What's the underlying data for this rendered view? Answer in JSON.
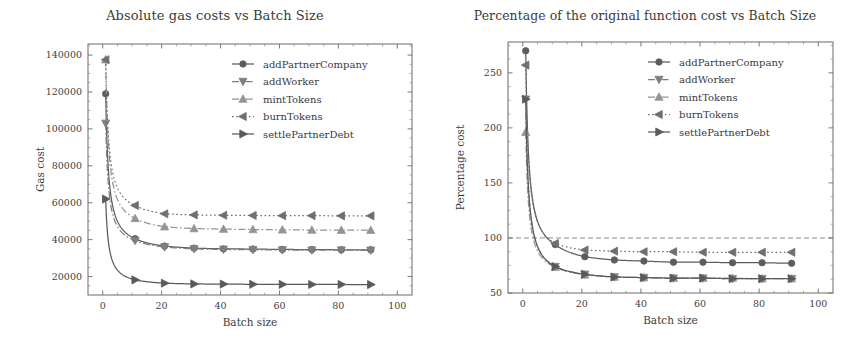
{
  "figure": {
    "width": 860,
    "height": 346,
    "background": "#ffffff",
    "ink_color": "#4a4a4a"
  },
  "series_style": [
    {
      "name": "addPartnerCompany",
      "color": "#5d5d5d",
      "marker": "circle",
      "dash": "none"
    },
    {
      "name": "addWorker",
      "color": "#7f7f7f",
      "marker": "triangle-down",
      "dash": "dashdot"
    },
    {
      "name": "mintTokens",
      "color": "#949494",
      "marker": "triangle-up",
      "dash": "dashdot"
    },
    {
      "name": "burnTokens",
      "color": "#6f6f6f",
      "marker": "triangle-left",
      "dash": "dotted"
    },
    {
      "name": "settlePartnerDebt",
      "color": "#5a5a5a",
      "marker": "triangle-right",
      "dash": "none"
    }
  ],
  "chart_data": [
    {
      "type": "line",
      "id": "absolute-gas-costs",
      "title": "Absolute gas costs vs Batch Size",
      "xlabel": "Batch size",
      "ylabel": "Gas cost",
      "xlim": [
        -5,
        105
      ],
      "ylim": [
        10000,
        146000
      ],
      "xticks": [
        0,
        20,
        40,
        60,
        80,
        100
      ],
      "yticks": [
        20000,
        40000,
        60000,
        80000,
        100000,
        120000,
        140000
      ],
      "grid": false,
      "legend_position": "upper right",
      "x": [
        1,
        11,
        21,
        31,
        41,
        51,
        61,
        71,
        81,
        91
      ],
      "series": [
        {
          "name": "addPartnerCompany",
          "values": [
            119000,
            40500,
            36500,
            35400,
            35000,
            34900,
            34700,
            34600,
            34500,
            34500
          ]
        },
        {
          "name": "addWorker",
          "values": [
            103000,
            39500,
            36000,
            35000,
            34700,
            34500,
            34400,
            34300,
            34300,
            34200
          ]
        },
        {
          "name": "mintTokens",
          "values": [
            137500,
            51500,
            47000,
            46000,
            45700,
            45500,
            45300,
            45200,
            45100,
            45100
          ]
        },
        {
          "name": "burnTokens",
          "values": [
            137500,
            58500,
            54000,
            53400,
            53200,
            53100,
            53000,
            53000,
            52900,
            52900
          ]
        },
        {
          "name": "settlePartnerDebt",
          "values": [
            62000,
            18200,
            16400,
            16000,
            15900,
            15800,
            15750,
            15700,
            15700,
            15650
          ]
        }
      ]
    },
    {
      "type": "line",
      "id": "percentage-original-cost",
      "title": "Percentage of the original function cost vs Batch Size",
      "xlabel": "Batch size",
      "ylabel": "Percentage cost",
      "xlim": [
        -5,
        105
      ],
      "ylim": [
        50,
        278
      ],
      "xticks": [
        0,
        20,
        40,
        60,
        80,
        100
      ],
      "yticks": [
        50,
        100,
        150,
        200,
        250
      ],
      "grid": false,
      "legend_position": "upper right",
      "reference_line": {
        "y": 100,
        "style": "dashed",
        "label": "100%"
      },
      "x": [
        1,
        11,
        21,
        31,
        41,
        51,
        61,
        71,
        81,
        91
      ],
      "series": [
        {
          "name": "addPartnerCompany",
          "values": [
            270,
            94,
            83,
            80,
            79,
            78,
            78,
            77.5,
            77.5,
            77
          ]
        },
        {
          "name": "addWorker",
          "values": [
            226,
            74,
            67,
            64.5,
            64,
            63.5,
            63.5,
            63,
            63,
            63
          ]
        },
        {
          "name": "mintTokens",
          "values": [
            196,
            73.5,
            66.5,
            64.5,
            64,
            63.5,
            63.5,
            63.5,
            63,
            63
          ]
        },
        {
          "name": "burnTokens",
          "values": [
            257,
            95,
            89,
            88,
            87.5,
            87.5,
            87,
            87,
            87,
            87
          ]
        },
        {
          "name": "settlePartnerDebt",
          "values": [
            226,
            74,
            67,
            64.5,
            64,
            63.5,
            63.5,
            63,
            63,
            63
          ]
        }
      ]
    }
  ]
}
